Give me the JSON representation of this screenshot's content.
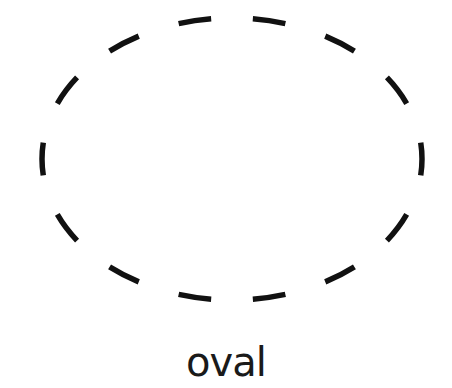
{
  "figure": {
    "shape": "oval",
    "outline_style": "dashed",
    "stroke_color": "#111111",
    "background": "#ffffff",
    "dash_count": 14,
    "label": "oval"
  }
}
